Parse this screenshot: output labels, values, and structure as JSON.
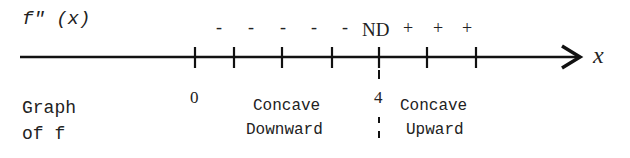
{
  "diagram": {
    "row_label": "f\" (x)",
    "axis_label": "x",
    "sign_chart": {
      "negative_signs": [
        "-",
        "-",
        "-",
        "-",
        "-"
      ],
      "critical_marker": "ND",
      "positive_signs": [
        "+",
        "+",
        "+"
      ]
    },
    "tick_labels": {
      "zero": "0",
      "four": "4"
    },
    "graph_label": {
      "line1": "Graph",
      "line2": "of f"
    },
    "regions": [
      {
        "line1": "Concave",
        "line2": "Downward"
      },
      {
        "line1": "Concave",
        "line2": "Upward"
      }
    ]
  }
}
